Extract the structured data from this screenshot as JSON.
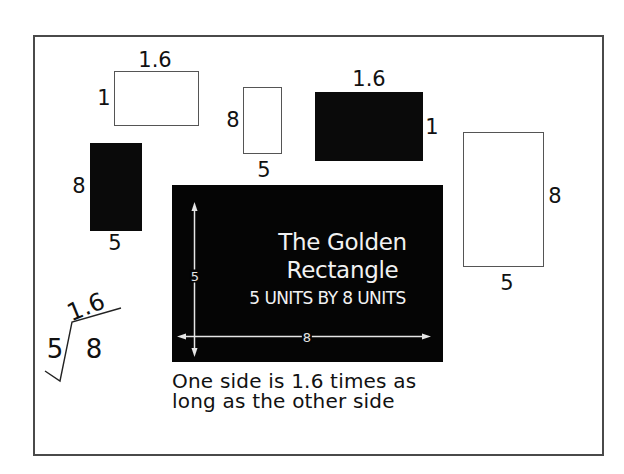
{
  "diagram": {
    "title": "The Golden Rectangle",
    "title_lines": [
      "The Golden",
      "Rectangle"
    ],
    "subtitle": "5 UNITS BY 8 UNITS",
    "caption_lines": [
      "One side is 1.6 times as",
      "long as the other side"
    ],
    "colors": {
      "fill": "#0a0a0a",
      "outline": "#555555",
      "text": "#111111",
      "inverse_text": "#f2f2f2",
      "frame": "#4a4a4a"
    },
    "main_rectangle": {
      "style": "filled",
      "height_label": "5",
      "width_label": "8"
    },
    "rectangles": [
      {
        "id": "rect-1",
        "style": "outline",
        "orientation": "landscape",
        "width_label": "1.6",
        "height_label": "1"
      },
      {
        "id": "rect-2",
        "style": "outline",
        "orientation": "portrait",
        "width_label": "5",
        "height_label": "8"
      },
      {
        "id": "rect-3",
        "style": "filled",
        "orientation": "landscape",
        "width_label": "1.6",
        "height_label": "1"
      },
      {
        "id": "rect-4",
        "style": "outline",
        "orientation": "portrait",
        "width_label": "5",
        "height_label": "8"
      },
      {
        "id": "rect-5",
        "style": "filled",
        "orientation": "portrait",
        "width_label": "5",
        "height_label": "8"
      }
    ],
    "long_division": {
      "divisor": "5",
      "dividend": "8",
      "quotient": "1.6"
    }
  }
}
